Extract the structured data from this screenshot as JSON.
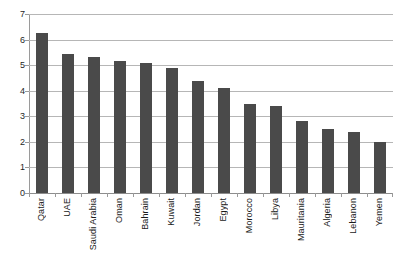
{
  "chart_data": {
    "type": "bar",
    "title": "",
    "xlabel": "",
    "ylabel": "",
    "ylim": [
      0,
      7
    ],
    "yticks": [
      0,
      1,
      2,
      3,
      4,
      5,
      6,
      7
    ],
    "grid": true,
    "legend": "none",
    "bar_color": "#4a4a4a",
    "gridline_color": "#b6b6b6",
    "axis_color": "#9a9a9a",
    "categories": [
      "Qatar",
      "UAE",
      "Saudi Arabia",
      "Oman",
      "Bahrain",
      "Kuwait",
      "Jordan",
      "Egypt",
      "Morocco",
      "Libya",
      "Mauritania",
      "Algeria",
      "Lebanon",
      "Yemen"
    ],
    "values": [
      6.25,
      5.45,
      5.3,
      5.15,
      5.1,
      4.9,
      4.4,
      4.1,
      3.5,
      3.4,
      2.8,
      2.5,
      2.4,
      2.0
    ]
  }
}
